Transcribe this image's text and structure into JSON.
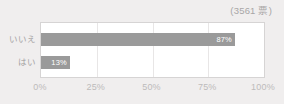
{
  "header": {
    "votes_total": "(3561 票)"
  },
  "colors": {
    "background": "#f0eeee",
    "plot_background": "#ffffff",
    "plot_border": "#d6d4d4",
    "bar": "#9a9a9a",
    "bar_value_text": "#ffffff",
    "gridline": "#e8e6e6",
    "axis_text": "#bdbbbb",
    "category_text": "#a5a3a3",
    "header_text": "#a8a6a6"
  },
  "chart_data": {
    "type": "bar",
    "orientation": "horizontal",
    "title": "",
    "subtitle": "",
    "xlabel": "",
    "ylabel": "",
    "categories": [
      "いいえ",
      "はい"
    ],
    "values": [
      87,
      13
    ],
    "value_labels": [
      "87%",
      "13%"
    ],
    "xlim": [
      0,
      100
    ],
    "xticks": [
      0,
      25,
      50,
      75,
      100
    ],
    "xtick_labels": [
      "0%",
      "25%",
      "50%",
      "75%",
      "100%"
    ],
    "gridlines": {
      "vertical_at": [
        25,
        50,
        75
      ],
      "horizontal": false
    },
    "legend": null,
    "annotations": [
      "(3561 票)"
    ]
  }
}
